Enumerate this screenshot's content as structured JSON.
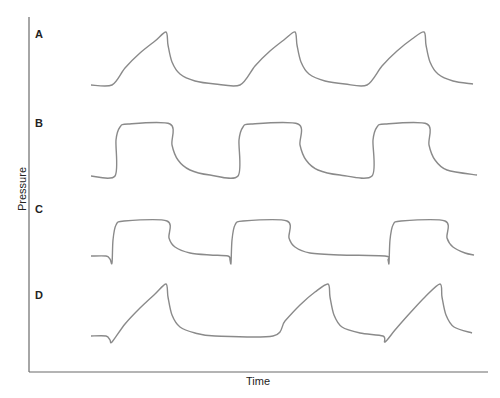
{
  "chart_data": {
    "type": "line",
    "title": "",
    "xlabel": "Time",
    "ylabel": "Pressure",
    "grid": false,
    "legend": null,
    "ticks": {
      "x": [],
      "y": []
    },
    "panels": [
      {
        "label": "A",
        "description": "Ramp rise to peak then exponential decay; no negative deflection",
        "breaths": 3,
        "points": [
          [
            91,
            85
          ],
          [
            112,
            85
          ],
          [
            125,
            68
          ],
          [
            140,
            53
          ],
          [
            155,
            41
          ],
          [
            166,
            32
          ],
          [
            168,
            45
          ],
          [
            172,
            62
          ],
          [
            180,
            74
          ],
          [
            195,
            81
          ],
          [
            215,
            84
          ],
          [
            240,
            85
          ],
          [
            255,
            66
          ],
          [
            270,
            51
          ],
          [
            285,
            39
          ],
          [
            295,
            32
          ],
          [
            297,
            45
          ],
          [
            301,
            62
          ],
          [
            309,
            74
          ],
          [
            325,
            81
          ],
          [
            345,
            84
          ],
          [
            367,
            85
          ],
          [
            382,
            66
          ],
          [
            397,
            51
          ],
          [
            412,
            39
          ],
          [
            424,
            32
          ],
          [
            426,
            45
          ],
          [
            430,
            62
          ],
          [
            438,
            74
          ],
          [
            453,
            81
          ],
          [
            473,
            84
          ]
        ]
      },
      {
        "label": "B",
        "description": "Square wave: rapid rise to plateau, plateau, exponential decay; no negative deflection",
        "breaths": 3,
        "points": [
          [
            91,
            176
          ],
          [
            115,
            176
          ],
          [
            116,
            140
          ],
          [
            120,
            127
          ],
          [
            128,
            124
          ],
          [
            170,
            124
          ],
          [
            172,
            145
          ],
          [
            178,
            160
          ],
          [
            190,
            170
          ],
          [
            210,
            175
          ],
          [
            238,
            176
          ],
          [
            239,
            140
          ],
          [
            243,
            127
          ],
          [
            251,
            124
          ],
          [
            298,
            124
          ],
          [
            300,
            145
          ],
          [
            306,
            160
          ],
          [
            318,
            170
          ],
          [
            340,
            175
          ],
          [
            372,
            176
          ],
          [
            373,
            140
          ],
          [
            377,
            127
          ],
          [
            385,
            124
          ],
          [
            427,
            124
          ],
          [
            429,
            145
          ],
          [
            435,
            160
          ],
          [
            447,
            170
          ],
          [
            477,
            175
          ]
        ]
      },
      {
        "label": "C",
        "description": "Square wave preceded by small negative deflection (patient trigger) at each breath onset",
        "breaths": 3,
        "points": [
          [
            91,
            256
          ],
          [
            106,
            256
          ],
          [
            110,
            259
          ],
          [
            112,
            263
          ],
          [
            113,
            240
          ],
          [
            116,
            225
          ],
          [
            124,
            221
          ],
          [
            167,
            221
          ],
          [
            169,
            238
          ],
          [
            175,
            247
          ],
          [
            190,
            253
          ],
          [
            210,
            255
          ],
          [
            228,
            256
          ],
          [
            230,
            260
          ],
          [
            231,
            263
          ],
          [
            232,
            240
          ],
          [
            235,
            225
          ],
          [
            243,
            221
          ],
          [
            287,
            221
          ],
          [
            289,
            238
          ],
          [
            295,
            247
          ],
          [
            310,
            253
          ],
          [
            340,
            255
          ],
          [
            385,
            256
          ],
          [
            388,
            260
          ],
          [
            389,
            263
          ],
          [
            390,
            240
          ],
          [
            393,
            225
          ],
          [
            401,
            221
          ],
          [
            445,
            221
          ],
          [
            447,
            238
          ],
          [
            453,
            247
          ],
          [
            465,
            253
          ],
          [
            474,
            255
          ]
        ]
      },
      {
        "label": "D",
        "description": "Ramp rise to peak then decay, preceded by negative deflection at breath onset",
        "breaths": 3,
        "points": [
          [
            91,
            336
          ],
          [
            106,
            336
          ],
          [
            110,
            340
          ],
          [
            112,
            342
          ],
          [
            125,
            324
          ],
          [
            140,
            308
          ],
          [
            155,
            294
          ],
          [
            166,
            284
          ],
          [
            168,
            297
          ],
          [
            172,
            315
          ],
          [
            180,
            327
          ],
          [
            195,
            333
          ],
          [
            215,
            336
          ],
          [
            273,
            336
          ],
          [
            285,
            321
          ],
          [
            300,
            305
          ],
          [
            315,
            292
          ],
          [
            328,
            284
          ],
          [
            330,
            297
          ],
          [
            334,
            315
          ],
          [
            342,
            327
          ],
          [
            360,
            333
          ],
          [
            383,
            336
          ],
          [
            385,
            342
          ],
          [
            395,
            330
          ],
          [
            410,
            313
          ],
          [
            425,
            297
          ],
          [
            440,
            284
          ],
          [
            442,
            297
          ],
          [
            446,
            315
          ],
          [
            454,
            327
          ],
          [
            472,
            333
          ]
        ]
      }
    ],
    "axis_ranges": {
      "x_px": [
        29,
        488
      ],
      "y_px": [
        17,
        372
      ]
    }
  },
  "labels": {
    "panel_a": "A",
    "panel_b": "B",
    "panel_c": "C",
    "panel_d": "D",
    "x_axis": "Time",
    "y_axis": "Pressure"
  },
  "colors": {
    "trace": "#8a8a8a",
    "axis": "#6b6b6b",
    "text": "#222222"
  }
}
